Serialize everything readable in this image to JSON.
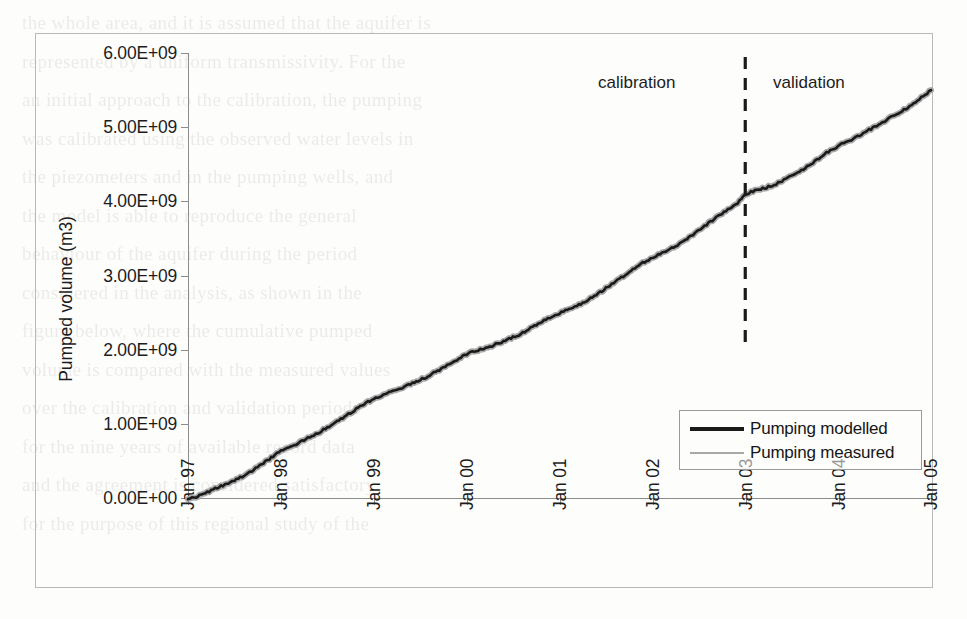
{
  "figure": {
    "ylabel": "Pumped volume (m3)",
    "y_ticks": [
      "0.00E+00",
      "1.00E+09",
      "2.00E+09",
      "3.00E+09",
      "4.00E+09",
      "5.00E+09",
      "6.00E+09"
    ],
    "x_ticks": [
      "Jan 97",
      "Jan 98",
      "Jan 99",
      "Jan 00",
      "Jan 01",
      "Jan 02",
      "Jan 03",
      "Jan 04",
      "Jan 05"
    ],
    "annotations": {
      "calibration": "calibration",
      "validation": "validation"
    },
    "legend": {
      "modelled": "Pumping modelled",
      "measured": "Pumping measured"
    },
    "colors": {
      "modelled": "#1a1a1a",
      "measured": "#a8a8a8",
      "axis": "#8c8c8c",
      "border": "#b9b9b9"
    }
  },
  "chart_data": {
    "type": "line",
    "title": "",
    "xlabel": "",
    "ylabel": "Pumped volume (m3)",
    "xlim": [
      "Jan 97",
      "Jan 05"
    ],
    "ylim": [
      0,
      6000000000
    ],
    "y_tick_values": [
      0,
      1000000000,
      2000000000,
      3000000000,
      4000000000,
      5000000000,
      6000000000
    ],
    "y_tick_labels": [
      "0.00E+00",
      "1.00E+09",
      "2.00E+09",
      "3.00E+09",
      "4.00E+09",
      "5.00E+09",
      "6.00E+09"
    ],
    "x_tick_labels": [
      "Jan 97",
      "Jan 98",
      "Jan 99",
      "Jan 00",
      "Jan 01",
      "Jan 02",
      "Jan 03",
      "Jan 04",
      "Jan 05"
    ],
    "grid": false,
    "legend_position": "lower-right",
    "annotations": [
      {
        "text": "calibration",
        "x": "Jul 02",
        "note": "period left of dashed divider"
      },
      {
        "text": "validation",
        "x": "Jul 03",
        "note": "period right of dashed divider"
      },
      {
        "text": "divider",
        "x": "Jan 03",
        "style": "vertical dashed line"
      }
    ],
    "x_fractional": [
      0,
      0.04,
      0.08,
      0.13,
      0.17,
      0.21,
      0.25,
      0.29,
      0.33,
      0.38,
      0.42,
      0.46,
      0.5,
      0.54,
      0.58,
      0.63,
      0.67,
      0.71,
      0.75,
      0.79,
      0.83,
      0.88,
      0.92,
      0.96,
      1.0
    ],
    "series": [
      {
        "name": "Pumping modelled",
        "color": "#1a1a1a",
        "x": [
          "Jan 97",
          "Jan 98",
          "Jan 99",
          "Jan 00",
          "Jan 01",
          "Jan 02",
          "Jan 03",
          "Jan 04",
          "Jan 05"
        ],
        "values": [
          0,
          650000000,
          1350000000,
          1950000000,
          2500000000,
          3250000000,
          4100000000,
          4750000000,
          5500000000
        ]
      },
      {
        "name": "Pumping measured",
        "color": "#a8a8a8",
        "x": [
          "Jan 97",
          "Jan 98",
          "Jan 99",
          "Jan 00",
          "Jan 01",
          "Jan 02",
          "Jan 03",
          "Jan 04",
          "Jan 05"
        ],
        "values": [
          0,
          650000000,
          1350000000,
          1950000000,
          2500000000,
          3250000000,
          4100000000,
          4750000000,
          5500000000
        ]
      }
    ],
    "monthly_cumulative": {
      "note": "Cumulative pumped volume sampled monthly from Jan 97 to Jan 05 (m3). Both series overlap almost exactly.",
      "modelled": [
        0,
        30000000,
        70000000,
        115000000,
        160000000,
        205000000,
        250000000,
        300000000,
        360000000,
        430000000,
        500000000,
        570000000,
        650000000,
        700000000,
        740000000,
        790000000,
        845000000,
        900000000,
        960000000,
        1020000000,
        1090000000,
        1160000000,
        1230000000,
        1290000000,
        1350000000,
        1395000000,
        1430000000,
        1470000000,
        1515000000,
        1560000000,
        1605000000,
        1650000000,
        1710000000,
        1770000000,
        1830000000,
        1890000000,
        1950000000,
        1985000000,
        2015000000,
        2050000000,
        2090000000,
        2130000000,
        2175000000,
        2220000000,
        2280000000,
        2345000000,
        2405000000,
        2455000000,
        2500000000,
        2545000000,
        2590000000,
        2640000000,
        2700000000,
        2765000000,
        2835000000,
        2905000000,
        2980000000,
        3055000000,
        3125000000,
        3190000000,
        3250000000,
        3300000000,
        3350000000,
        3405000000,
        3470000000,
        3540000000,
        3615000000,
        3690000000,
        3765000000,
        3840000000,
        3910000000,
        3975000000,
        4100000000,
        4140000000,
        4170000000,
        4200000000,
        4240000000,
        4290000000,
        4345000000,
        4405000000,
        4470000000,
        4540000000,
        4620000000,
        4690000000,
        4750000000,
        4800000000,
        4850000000,
        4905000000,
        4965000000,
        5025000000,
        5085000000,
        5145000000,
        5205000000,
        5270000000,
        5340000000,
        5420000000,
        5500000000
      ]
    }
  }
}
